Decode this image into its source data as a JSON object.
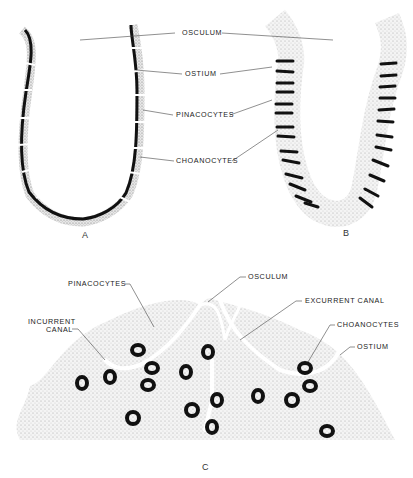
{
  "figure": {
    "panel_a": {
      "letter": "A",
      "labels": {
        "osculum": "OSCULUM",
        "ostium": "OSTIUM",
        "pinacocytes": "PINACOCYTES",
        "choanocytes": "CHOANOCYTES"
      }
    },
    "panel_b": {
      "letter": "B"
    },
    "panel_c": {
      "letter": "C",
      "labels": {
        "pinacocytes": "PINACOCYTES",
        "osculum": "OSCULUM",
        "excurrent_canal": "EXCURRENT CANAL",
        "incurrent_canal_1": "INCURRENT",
        "incurrent_canal_2": "CANAL",
        "choanocytes": "CHOANOCYTES",
        "ostium": "OSTIUM"
      }
    }
  }
}
